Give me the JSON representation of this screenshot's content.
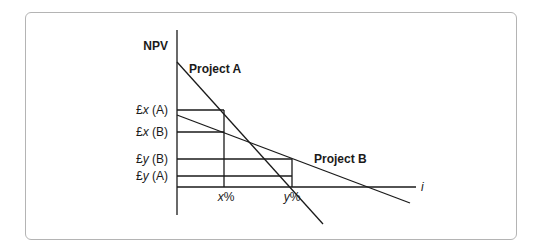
{
  "diagram": {
    "type": "npv-profile",
    "y_axis_label": "NPV",
    "x_axis_label": "i",
    "series": [
      {
        "name": "Project A",
        "label": "Project A",
        "start": [
          177,
          62
        ],
        "end": [
          323,
          224
        ]
      },
      {
        "name": "Project B",
        "label": "Project B",
        "start": [
          177,
          115
        ],
        "end": [
          410,
          203
        ]
      }
    ],
    "y_labels": [
      {
        "id": "x_a",
        "prefix": "£",
        "var": "x",
        "suffix": " (A)",
        "y": 110
      },
      {
        "id": "x_b",
        "prefix": "£",
        "var": "x",
        "suffix": " (B)",
        "y": 132
      },
      {
        "id": "y_b",
        "prefix": "£",
        "var": "y",
        "suffix": " (B)",
        "y": 159
      },
      {
        "id": "y_a",
        "prefix": "£",
        "var": "y",
        "suffix": " (A)",
        "y": 176
      }
    ],
    "x_labels": [
      {
        "id": "x_pct",
        "var": "x",
        "suffix": "%",
        "x": 224
      },
      {
        "id": "y_pct",
        "var": "y",
        "suffix": "%",
        "x": 292
      }
    ],
    "colors": {
      "line": "#1a1a1a",
      "frame": "#b4b4b4"
    }
  }
}
